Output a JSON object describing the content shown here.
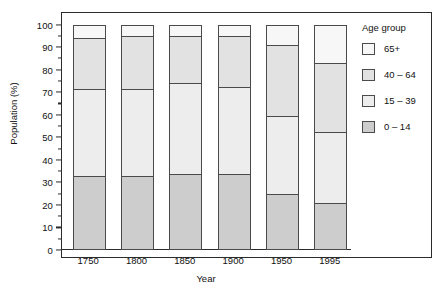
{
  "chart_data": {
    "type": "bar",
    "subtype": "stacked-bar-100-percent",
    "title": "",
    "xlabel": "Year",
    "ylabel": "Population (%)",
    "categories": [
      "1750",
      "1800",
      "1850",
      "1900",
      "1950",
      "1995"
    ],
    "ylim": [
      0,
      100
    ],
    "yticks": [
      0,
      10,
      20,
      30,
      40,
      50,
      60,
      70,
      80,
      90,
      100
    ],
    "ytick_labels": [
      "0",
      "10",
      "20",
      "30",
      "40",
      "50",
      "60",
      "70",
      "80",
      "90",
      "100"
    ],
    "grid": false,
    "legend_position": "right",
    "legend_title": "Age group",
    "series": [
      {
        "name": "0 – 14",
        "color": "#cdcdcd",
        "values": [
          32,
          32,
          33,
          33,
          24,
          20
        ]
      },
      {
        "name": "15 – 39",
        "color": "#ededed",
        "values": [
          39,
          39,
          41,
          39,
          35,
          32
        ]
      },
      {
        "name": "40 – 64",
        "color": "#e2e2e2",
        "values": [
          23,
          24,
          21,
          23,
          32,
          31
        ]
      },
      {
        "name": "65+",
        "color": "#f7f7f7",
        "values": [
          6,
          5,
          5,
          5,
          9,
          17
        ]
      }
    ],
    "cumulative_tops": {
      "1750": [
        32,
        71,
        94,
        100
      ],
      "1800": [
        32,
        71,
        95,
        100
      ],
      "1850": [
        33,
        74,
        95,
        100
      ],
      "1900": [
        33,
        72,
        95,
        100
      ],
      "1950": [
        24,
        59,
        91,
        100
      ],
      "1995": [
        20,
        52,
        83,
        100
      ]
    }
  },
  "axes": {
    "y_title": "Population (%)",
    "x_title": "Year"
  },
  "legend": {
    "title": "Age group",
    "items": [
      {
        "label": "65+",
        "color": "#f7f7f7"
      },
      {
        "label": "40 – 64",
        "color": "#e2e2e2"
      },
      {
        "label": "15 – 39",
        "color": "#ededed"
      },
      {
        "label": "0 – 14",
        "color": "#cdcdcd"
      }
    ]
  },
  "colors": {
    "axis": "#2b2b2b",
    "bar_outline": "#4a4a4a",
    "background": "#ffffff"
  }
}
